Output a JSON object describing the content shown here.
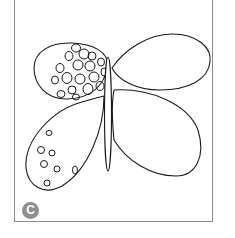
{
  "figure": {
    "label": "C",
    "colors": {
      "line": "#1a1a1a",
      "frame": "#8c8c8c",
      "badge": "#8f8f8f",
      "badge_text": "#ffffff"
    }
  }
}
